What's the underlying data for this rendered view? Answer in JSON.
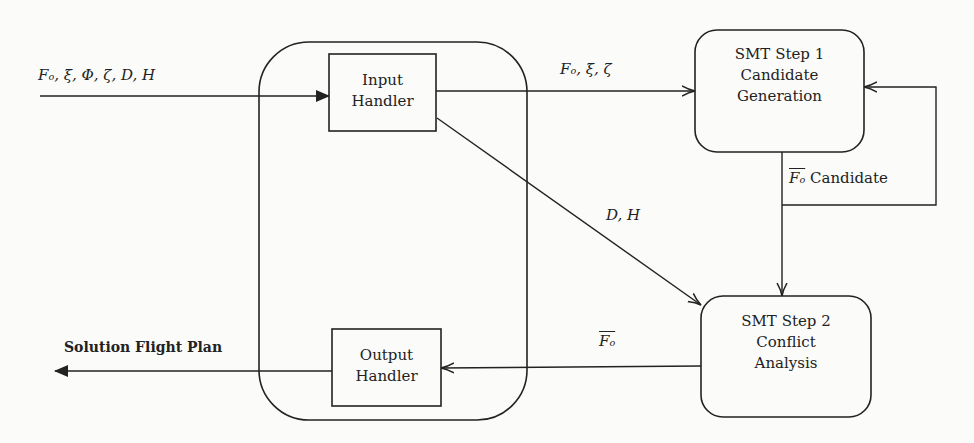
{
  "diagram": {
    "type": "flowchart",
    "nodes": {
      "input_handler": {
        "lines": [
          "Input",
          "Handler"
        ]
      },
      "output_handler": {
        "lines": [
          "Output",
          "Handler"
        ]
      },
      "smt_step1": {
        "lines": [
          "SMT Step 1",
          "Candidate",
          "Generation"
        ]
      },
      "smt_step2": {
        "lines": [
          "SMT Step 2",
          "Conflict",
          "Analysis"
        ]
      }
    },
    "edges": {
      "input_in": {
        "label": "Fₒ, ξ, Φ, ζ, D, H"
      },
      "input_to_step1": {
        "label": "Fₒ, ξ, ζ"
      },
      "input_to_step2": {
        "label": "D, H"
      },
      "step1_to_step2": {
        "label_symbol": "Fₒ",
        "label_text": "Candidate"
      },
      "step2_to_output": {
        "label_symbol": "Fₒ"
      },
      "output_out": {
        "label": "Solution Flight Plan"
      }
    },
    "colors": {
      "stroke": "#222222",
      "background": "#fbfbfa"
    }
  }
}
